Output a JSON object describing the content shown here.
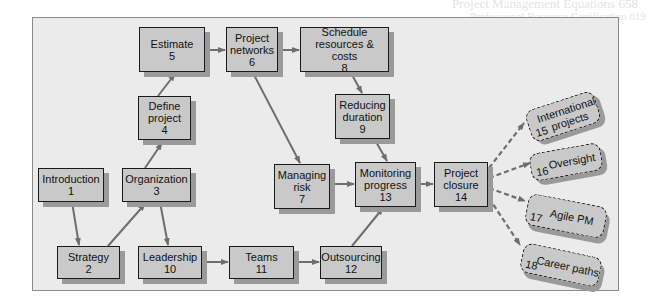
{
  "bleed_through": [
    "Project Management Equations 658",
    "Professional Resource Certification 619",
    "Project networks 467",
    "Resourcing Stability 471",
    "Matrices 555",
    "Summary Key Patterns 615",
    "Resourcing"
  ],
  "colors": {
    "background": "#ebebeb",
    "node_fill": "#c9c9c9",
    "node_border": "#1a1a1a",
    "shadow": "#9a9a9a",
    "arrow": "#6e6e6e"
  },
  "nodes": [
    {
      "id": 1,
      "label": "Introduction",
      "num": "1"
    },
    {
      "id": 2,
      "label": "Strategy",
      "num": "2"
    },
    {
      "id": 3,
      "label": "Organization",
      "num": "3"
    },
    {
      "id": 4,
      "label": "Define project",
      "l1": "Define",
      "l2": "project",
      "num": "4"
    },
    {
      "id": 5,
      "label": "Estimate",
      "num": "5"
    },
    {
      "id": 6,
      "label": "Project networks",
      "l1": "Project",
      "l2": "networks",
      "num": "6"
    },
    {
      "id": 7,
      "label": "Managing risk",
      "l1": "Managing",
      "l2": "risk",
      "num": "7"
    },
    {
      "id": 8,
      "label": "Schedule resources & costs",
      "l1": "Schedule",
      "l2": "resources & costs",
      "num": "8"
    },
    {
      "id": 9,
      "label": "Reducing duration",
      "l1": "Reducing",
      "l2": "duration",
      "num": "9"
    },
    {
      "id": 10,
      "label": "Leadership",
      "num": "10"
    },
    {
      "id": 11,
      "label": "Teams",
      "num": "11"
    },
    {
      "id": 12,
      "label": "Outsourcing",
      "num": "12"
    },
    {
      "id": 13,
      "label": "Monitoring progress",
      "l1": "Monitoring",
      "l2": "progress",
      "num": "13"
    },
    {
      "id": 14,
      "label": "Project closure",
      "l1": "Project",
      "l2": "closure",
      "num": "14"
    }
  ],
  "optional_nodes": [
    {
      "id": 15,
      "label": "International projects",
      "l1": "International",
      "l2": "projects",
      "num": "15"
    },
    {
      "id": 16,
      "label": "Oversight",
      "num": "16"
    },
    {
      "id": 17,
      "label": "Agile PM",
      "num": "17"
    },
    {
      "id": 18,
      "label": "Career paths",
      "num": "18"
    }
  ],
  "edges": [
    {
      "from": 1,
      "to": 2
    },
    {
      "from": 2,
      "to": 3
    },
    {
      "from": 3,
      "to": 4
    },
    {
      "from": 3,
      "to": 10
    },
    {
      "from": 4,
      "to": 5
    },
    {
      "from": 5,
      "to": 6
    },
    {
      "from": 6,
      "to": 8
    },
    {
      "from": 6,
      "to": 7
    },
    {
      "from": 8,
      "to": 9
    },
    {
      "from": 9,
      "to": 13
    },
    {
      "from": 7,
      "to": 13
    },
    {
      "from": 10,
      "to": 11
    },
    {
      "from": 11,
      "to": 12
    },
    {
      "from": 12,
      "to": 13
    },
    {
      "from": 13,
      "to": 14
    },
    {
      "from": 14,
      "to": 15,
      "style": "dashed"
    },
    {
      "from": 14,
      "to": 16,
      "style": "dashed"
    },
    {
      "from": 14,
      "to": 17,
      "style": "dashed"
    },
    {
      "from": 14,
      "to": 18,
      "style": "dashed"
    }
  ]
}
